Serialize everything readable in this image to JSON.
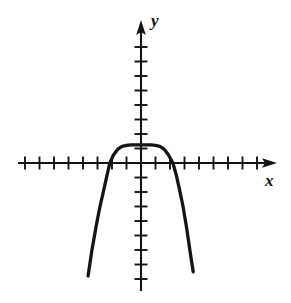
{
  "figure": {
    "background_color": "#ffffff",
    "ink_color": "#141414",
    "width": 291,
    "height": 303
  },
  "axes": {
    "x_label": "x",
    "y_label": "y",
    "origin_px": {
      "x": 141,
      "y": 163
    },
    "tick_spacing_px": 14.5,
    "x_axis": {
      "start_px": 18,
      "end_px": 277,
      "arrow": "right",
      "tick_count_left": 8,
      "tick_count_right": 8
    },
    "y_axis": {
      "start_px": 20,
      "end_px": 291,
      "arrow": "up",
      "tick_count_above": 8,
      "tick_count_below": 8
    }
  },
  "chart_data": {
    "type": "line",
    "title": "",
    "subtitle": "",
    "xlabel": "x",
    "ylabel": "y",
    "grid": false,
    "legend": null,
    "axis_ticks_only": true,
    "tick_labels_shown": false,
    "xlim": [
      -8.5,
      9.4
    ],
    "ylim": [
      -8.8,
      9.9
    ],
    "curve_description": "Downward-opening flat-topped even-power polynomial (quartic-like), vertex above origin, two x-intercepts, steeply falling arms",
    "vertex": {
      "x": 0,
      "y": 1.25
    },
    "x_intercepts": [
      -2.15,
      2.2
    ],
    "endpoints": [
      {
        "x": -3.65,
        "y": -7.8
      },
      {
        "x": 3.6,
        "y": -7.5
      }
    ],
    "series": [
      {
        "name": "curve",
        "x": [
          -3.65,
          -3.4,
          -3.1,
          -2.85,
          -2.6,
          -2.4,
          -2.15,
          -1.9,
          -1.6,
          -1.3,
          -1.0,
          -0.7,
          -0.35,
          0.0,
          0.35,
          0.7,
          1.0,
          1.3,
          1.6,
          1.9,
          2.2,
          2.45,
          2.65,
          2.9,
          3.15,
          3.4,
          3.6
        ],
        "y": [
          -7.8,
          -6.1,
          -4.4,
          -3.1,
          -2.0,
          -1.1,
          0.0,
          0.55,
          0.95,
          1.15,
          1.22,
          1.25,
          1.25,
          1.25,
          1.25,
          1.25,
          1.22,
          1.15,
          0.95,
          0.55,
          0.0,
          -0.9,
          -1.8,
          -3.0,
          -4.5,
          -6.2,
          -7.5
        ]
      }
    ]
  }
}
